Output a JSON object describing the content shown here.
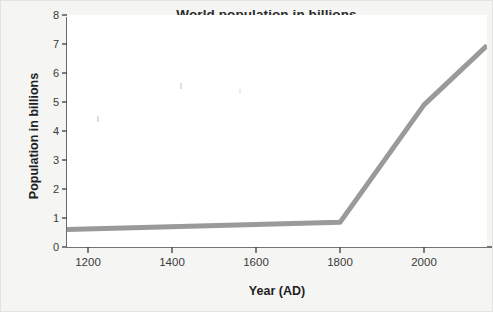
{
  "figure": {
    "background_color": "#f5f5f3",
    "plot_background_color": "#ffffff",
    "border_color": "#e3e3e0"
  },
  "chart_data": {
    "type": "line",
    "title": "World population in billions",
    "xlabel": "Year (AD)",
    "ylabel": "Population in billions",
    "xlim": [
      1150,
      2150
    ],
    "ylim": [
      0,
      8
    ],
    "grid": false,
    "legend": null,
    "legend_position": "none",
    "line_color": "#9a9a9a",
    "line_width_px": 5,
    "xticks": [
      1200,
      1400,
      1600,
      1800,
      2000
    ],
    "xtick_labels": [
      "1200",
      "1400",
      "1600",
      "1800",
      "2000"
    ],
    "yticks": [
      0,
      1,
      2,
      3,
      4,
      5,
      6,
      7,
      8
    ],
    "ytick_labels": [
      "0",
      "1",
      "2",
      "3",
      "4",
      "5",
      "6",
      "7",
      "8"
    ],
    "series": [
      {
        "name": "World population",
        "x": [
          1150,
          1800,
          2000,
          2150
        ],
        "values": [
          0.6,
          0.85,
          4.9,
          6.95
        ]
      }
    ]
  }
}
